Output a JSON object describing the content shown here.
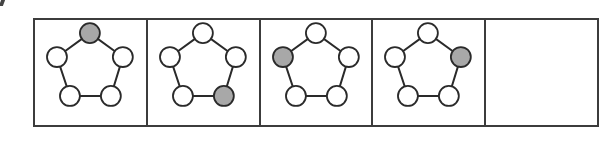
{
  "puzzle": {
    "type": "sequence",
    "shape": "pentagon",
    "node_count": 5,
    "colors": {
      "frame": "#3c3c3c",
      "edge": "#2a2a2a",
      "node_fill_empty": "#ffffff",
      "node_fill_shaded": "#a8a8a8",
      "node_stroke": "#2a2a2a"
    },
    "node_positions": [
      "top",
      "upper-right",
      "lower-right",
      "lower-left",
      "upper-left"
    ],
    "cells": [
      {
        "index": 1,
        "shaded_node": "top",
        "shaded_index": 0
      },
      {
        "index": 2,
        "shaded_node": "lower-right",
        "shaded_index": 2
      },
      {
        "index": 3,
        "shaded_node": "upper-left",
        "shaded_index": 4
      },
      {
        "index": 4,
        "shaded_node": "upper-right",
        "shaded_index": 1
      },
      {
        "index": 5,
        "shaded_node": null,
        "shaded_index": null,
        "empty": true
      }
    ]
  }
}
